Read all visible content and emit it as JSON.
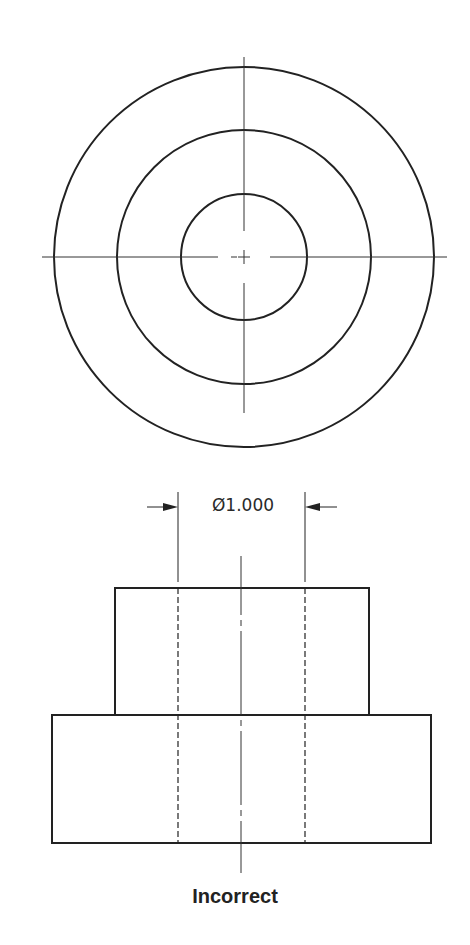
{
  "drawing": {
    "top_view": {
      "center": [
        244,
        257
      ],
      "circles_radii": [
        190,
        127,
        63
      ]
    },
    "front_view": {
      "upper_block": {
        "x1": 115,
        "y1": 588,
        "x2": 369,
        "y2": 715
      },
      "lower_block": {
        "x1": 52,
        "y1": 715,
        "x2": 431,
        "y2": 843
      },
      "hidden_lines_x": [
        178,
        305
      ]
    },
    "dimension": {
      "label": "Ø1.000",
      "symbol": "diameter",
      "value": "1.000"
    },
    "caption": "Incorrect"
  }
}
